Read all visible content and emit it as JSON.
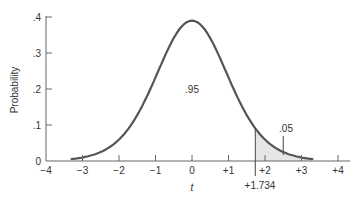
{
  "chart_data": {
    "type": "area",
    "title": "",
    "xlabel": "t",
    "ylabel": "Probability",
    "xlim": [
      -4,
      4
    ],
    "ylim": [
      0,
      0.4
    ],
    "x_ticks": [
      "-4",
      "-3",
      "-2",
      "-1",
      "0",
      "+1",
      "+2",
      "+3",
      "+4"
    ],
    "y_ticks": [
      "0",
      ".1",
      ".2",
      ".3",
      ".4"
    ],
    "curve": "t-distribution density, peak ~0.39 at t=0, drawn from t=-3.3 to t=+3.3",
    "critical_value": 1.734,
    "critical_label": "+1.734",
    "annotations": [
      {
        "text": ".95",
        "x": 0,
        "y": 0.18,
        "meaning": "area left of +1.734"
      },
      {
        "text": ".05",
        "x": 2.5,
        "y": 0.07,
        "meaning": "shaded right tail area"
      }
    ],
    "shaded_region": {
      "from": 1.734,
      "to": 3.3,
      "color": "#e6e6e6"
    },
    "grid": false,
    "legend": null
  },
  "labels": {
    "ylabel": "Probability",
    "xlabel": "t",
    "center_area": ".95",
    "tail_area": ".05",
    "critical": "+1.734"
  },
  "colors": {
    "curve": "#555555",
    "axis": "#666666",
    "shade": "#e6e6e6"
  }
}
